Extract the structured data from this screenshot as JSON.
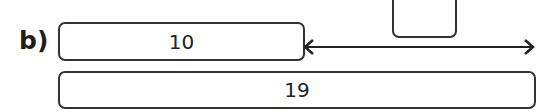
{
  "diagram": {
    "part_label": "b)",
    "boxes": [
      {
        "id": "top",
        "value": "10"
      },
      {
        "id": "bottom",
        "value": "19"
      },
      {
        "id": "small",
        "value": ""
      }
    ],
    "arrow": {
      "type": "double-headed",
      "label": ""
    }
  }
}
